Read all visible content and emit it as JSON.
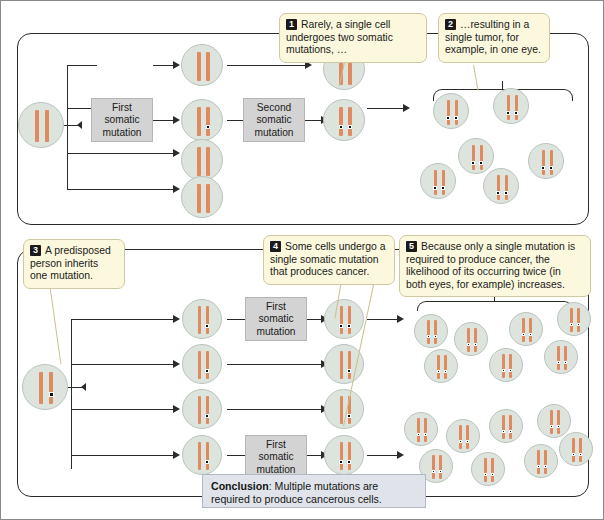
{
  "diagram": {
    "conclusion_prefix": "Conclusion",
    "conclusion_text": ": Multiple mutations are required to produce cancerous cells."
  },
  "callouts": [
    {
      "num": "1",
      "text": "Rarely, a single cell undergoes two somatic mutations, …"
    },
    {
      "num": "2",
      "text": "…resulting in a single tumor, for example, in one eye."
    },
    {
      "num": "3",
      "text": "A predisposed person inherits one mutation."
    },
    {
      "num": "4",
      "text": "Some cells undergo a single somatic mutation that produces cancer."
    },
    {
      "num": "5",
      "text": "Because only a single mutation is required to produce cancer, the likelihood of its occurring twice (in both eyes, for example) increases."
    }
  ],
  "labels": {
    "first_somatic_mutation": "First somatic mutation",
    "second_somatic_mutation": "Second somatic mutation"
  },
  "colors": {
    "cell_fill": "#dde4dd",
    "cell_stroke": "#b9c4bc",
    "chromosome": "#e08a5f",
    "mutation_dot": "#101010",
    "callout_fill": "#fbf8dd",
    "callout_stroke": "#cfc9a0",
    "label_fill": "#d3d3d3",
    "conclusion_fill": "#e0e4ea",
    "line": "#2b2b2b"
  },
  "chart_data": {
    "type": "diagram",
    "panels": [
      {
        "id": "top",
        "name": "Sporadic (non-inherited) retinoblastoma pathway",
        "founder_cell": {
          "mutations": 0
        },
        "branch_count": 4,
        "stage1_cells": [
          {
            "row": 1,
            "mutations": 0
          },
          {
            "row": 2,
            "mutations": 1
          },
          {
            "row": 3,
            "mutations": 0
          },
          {
            "row": 4,
            "mutations": 0
          }
        ],
        "stage2_cells": [
          {
            "row": 1,
            "mutations": 0
          },
          {
            "row": 2,
            "mutations": 2
          }
        ],
        "labeled_steps": [
          {
            "row": 1,
            "label": "First somatic mutation"
          },
          {
            "row": 2,
            "label": "Second somatic mutation"
          }
        ],
        "tumor_clusters": [
          {
            "cells": 6,
            "mutations_per_cell": 2
          }
        ]
      },
      {
        "id": "bottom",
        "name": "Inherited predisposition retinoblastoma pathway",
        "founder_cell": {
          "mutations": 1
        },
        "branch_count": 4,
        "stage1_cells": [
          {
            "row": 1,
            "mutations": 1
          },
          {
            "row": 2,
            "mutations": 1
          },
          {
            "row": 3,
            "mutations": 1
          },
          {
            "row": 4,
            "mutations": 1
          }
        ],
        "stage2_cells": [
          {
            "row": 1,
            "mutations": 2
          },
          {
            "row": 2,
            "mutations": 1
          },
          {
            "row": 3,
            "mutations": 1
          },
          {
            "row": 4,
            "mutations": 2
          }
        ],
        "labeled_steps": [
          {
            "row": 1,
            "label": "First somatic mutation"
          },
          {
            "row": 4,
            "label": "First somatic mutation"
          }
        ],
        "tumor_clusters": [
          {
            "cells": 7,
            "mutations_per_cell": 2
          },
          {
            "cells": 8,
            "mutations_per_cell": 2
          }
        ]
      }
    ]
  }
}
